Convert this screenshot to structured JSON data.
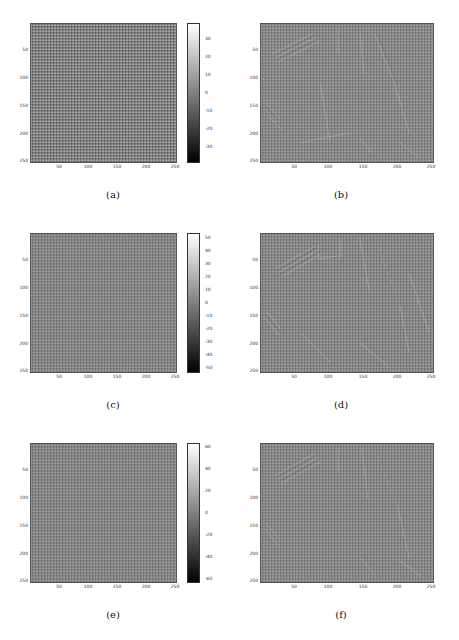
{
  "figure": {
    "panels": [
      {
        "id": "a",
        "caption": "(a)",
        "type": "noise-image",
        "yticks": [
          "50",
          "100",
          "150",
          "200",
          "250"
        ],
        "xticks": [
          "50",
          "100",
          "150",
          "200",
          "250"
        ],
        "colorbar": [
          "30",
          "20",
          "10",
          "0",
          "-10",
          "-20",
          "-30"
        ]
      },
      {
        "id": "b",
        "caption": "(b)",
        "type": "edge-image",
        "yticks": [
          "50",
          "100",
          "150",
          "200",
          "250"
        ],
        "xticks": [
          "50",
          "100",
          "150",
          "200",
          "250"
        ]
      },
      {
        "id": "c",
        "caption": "(c)",
        "type": "noise-image",
        "yticks": [
          "50",
          "100",
          "150",
          "200",
          "250"
        ],
        "xticks": [
          "50",
          "100",
          "150",
          "200",
          "250"
        ],
        "colorbar": [
          "50",
          "40",
          "30",
          "20",
          "10",
          "0",
          "-10",
          "-20",
          "-30",
          "-40",
          "-50"
        ]
      },
      {
        "id": "d",
        "caption": "(d)",
        "type": "edge-image",
        "yticks": [
          "50",
          "100",
          "150",
          "200",
          "250"
        ],
        "xticks": [
          "50",
          "100",
          "150",
          "200",
          "250"
        ]
      },
      {
        "id": "e",
        "caption": "(e)",
        "type": "noise-image",
        "yticks": [
          "50",
          "100",
          "150",
          "200",
          "250"
        ],
        "xticks": [
          "50",
          "100",
          "150",
          "200",
          "250"
        ],
        "colorbar": [
          "60",
          "40",
          "20",
          "0",
          "-20",
          "-40",
          "-60"
        ]
      },
      {
        "id": "f",
        "caption": "(f)",
        "type": "edge-image",
        "yticks": [
          "50",
          "100",
          "150",
          "200",
          "250"
        ],
        "xticks": [
          "50",
          "100",
          "150",
          "200",
          "250"
        ]
      }
    ]
  }
}
